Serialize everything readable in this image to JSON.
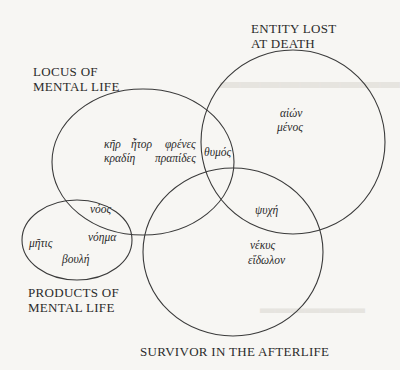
{
  "diagram": {
    "type": "venn",
    "sets": [
      {
        "id": "locus",
        "label_line1": "LOCUS OF",
        "label_line2": "MENTAL LIFE"
      },
      {
        "id": "entity",
        "label_line1": "ENTITY LOST",
        "label_line2": "AT DEATH"
      },
      {
        "id": "products",
        "label_line1": "PRODUCTS OF",
        "label_line2": "MENTAL LIFE"
      },
      {
        "id": "survivor",
        "label_line1": "SURVIVOR IN THE AFTERLIFE"
      }
    ],
    "terms": {
      "ker": "κῆρ",
      "etor": "ἦτορ",
      "phrenes": "φρένες",
      "kradie": "κραδίη",
      "prapides": "πραπίδες",
      "thumos": "θυμός",
      "aion": "αἰών",
      "menos": "μένος",
      "psuche": "ψυχή",
      "nekus": "νέκυς",
      "eidolon": "εἴδωλον",
      "noos": "νόος",
      "noema": "νόημα",
      "metis": "μῆτις",
      "boule": "βουλή"
    },
    "colors": {
      "stroke": "#3a3a3a",
      "text": "#2b2b2b",
      "background": "#f7f6f3"
    }
  }
}
